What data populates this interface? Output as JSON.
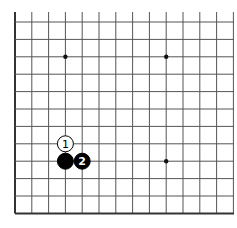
{
  "diagram": {
    "type": "go-board-partial",
    "colors": {
      "background": "#ffffff",
      "grid_line": "#555555",
      "edge_line": "#333333",
      "black_stone": "#000000",
      "white_stone": "#ffffff",
      "star_point": "#111111"
    },
    "grid": {
      "x_lines": [
        15,
        31.8,
        48.6,
        65.4,
        82.2,
        99,
        115.8,
        132.6,
        149.4,
        166.2,
        183,
        199.8,
        216.6,
        233.4
      ],
      "y_lines": [
        22,
        39.4,
        56.8,
        74.2,
        91.6,
        109,
        126.4,
        143.8,
        161.2,
        178.6,
        196,
        213.4
      ],
      "top_extent": 12,
      "right_extent": 234,
      "left_edge_x": 15,
      "bottom_edge_y": 213.4
    },
    "star_points": [
      {
        "x": 65.4,
        "y": 56.8
      },
      {
        "x": 166.2,
        "y": 56.8
      },
      {
        "x": 166.2,
        "y": 161.2
      }
    ],
    "stones": [
      {
        "color": "white",
        "x": 65.4,
        "y": 143.8,
        "label": "1"
      },
      {
        "color": "black",
        "x": 65.4,
        "y": 161.2,
        "label": ""
      },
      {
        "color": "black",
        "x": 82.2,
        "y": 161.2,
        "label": "2"
      }
    ]
  }
}
